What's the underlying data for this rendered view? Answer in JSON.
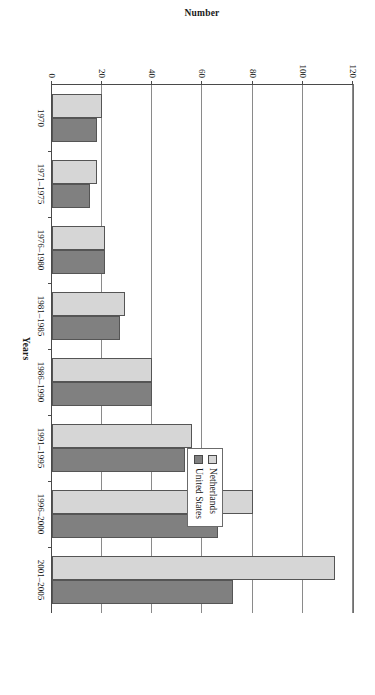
{
  "chart_data": {
    "type": "bar",
    "title": "",
    "subtitle": "",
    "orientation": "vertical",
    "xlabel": "Years",
    "ylabel": "Number",
    "ylim": [
      0,
      120
    ],
    "yticks": [
      0,
      20,
      40,
      60,
      80,
      100,
      120
    ],
    "ytick_labels": [
      "0",
      "20",
      "40",
      "60",
      "80",
      "100",
      "120"
    ],
    "grid": true,
    "legend_position": "top-right",
    "categories": [
      "1970",
      "1971–1975",
      "1976–1980",
      "1981–1985",
      "1986–1990",
      "1991–1995",
      "1996–2000",
      "2001–2005"
    ],
    "series": [
      {
        "name": "Netherlands",
        "color": "#d6d6d6",
        "values": [
          20,
          18,
          21,
          29,
          40,
          56,
          80,
          113
        ]
      },
      {
        "name": "United States",
        "color": "#808080",
        "values": [
          18,
          15,
          21,
          27,
          40,
          53,
          66,
          72
        ]
      }
    ]
  },
  "legend": {
    "items": [
      {
        "label": "Netherlands",
        "swatch": "light-gray-swatch"
      },
      {
        "label": "United States",
        "swatch": "dark-gray-swatch"
      }
    ]
  },
  "axes": {
    "x_title": "Years",
    "y_title": "Number"
  }
}
